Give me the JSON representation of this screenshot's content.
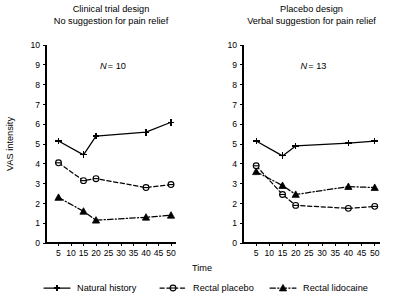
{
  "figure": {
    "y_axis_label": "VAS intensity",
    "x_axis_label": "Time"
  },
  "legend": {
    "items": [
      {
        "label": "Natural history",
        "marker": "plus-marker",
        "line": "solid"
      },
      {
        "label": "Rectal placebo",
        "marker": "circle-marker",
        "line": "dashed"
      },
      {
        "label": "Rectal lidocaine",
        "marker": "triangle-marker",
        "line": "dash-dot"
      }
    ]
  },
  "chart_data": [
    {
      "type": "line",
      "panel": "left",
      "title": "Clinical trial design",
      "subtitle": "No suggestion for pain relief",
      "annotation": "N = 10",
      "annotation_symbol": "N",
      "annotation_value": "= 10",
      "xlabel": "Time",
      "ylabel": "VAS intensity",
      "xlim": [
        0,
        52
      ],
      "ylim": [
        0,
        10
      ],
      "xticks": [
        5,
        10,
        15,
        20,
        25,
        30,
        35,
        40,
        45,
        50
      ],
      "yticks": [
        0,
        1,
        2,
        3,
        4,
        5,
        6,
        7,
        8,
        9,
        10
      ],
      "grid": false,
      "x": [
        5,
        15,
        20,
        40,
        50
      ],
      "series": [
        {
          "name": "Natural history",
          "values": [
            5.15,
            4.45,
            5.4,
            5.6,
            6.1
          ]
        },
        {
          "name": "Rectal placebo",
          "values": [
            4.05,
            3.15,
            3.25,
            2.8,
            2.95
          ]
        },
        {
          "name": "Rectal lidocaine",
          "values": [
            2.3,
            1.6,
            1.15,
            1.3,
            1.4
          ]
        }
      ]
    },
    {
      "type": "line",
      "panel": "right",
      "title": "Placebo design",
      "subtitle": "Verbal suggestion for pain relief",
      "annotation": "N = 13",
      "annotation_symbol": "N",
      "annotation_value": "= 13",
      "xlabel": "Time",
      "ylabel": "VAS intensity",
      "xlim": [
        0,
        52
      ],
      "ylim": [
        0,
        10
      ],
      "xticks": [
        5,
        10,
        15,
        20,
        25,
        30,
        35,
        40,
        45,
        50
      ],
      "yticks": [
        0,
        1,
        2,
        3,
        4,
        5,
        6,
        7,
        8,
        9,
        10
      ],
      "grid": false,
      "x": [
        5,
        15,
        20,
        40,
        50
      ],
      "series": [
        {
          "name": "Natural history",
          "values": [
            5.15,
            4.4,
            4.9,
            5.05,
            5.15
          ]
        },
        {
          "name": "Rectal placebo",
          "values": [
            3.9,
            2.45,
            1.9,
            1.75,
            1.85
          ]
        },
        {
          "name": "Rectal lidocaine",
          "values": [
            3.6,
            2.9,
            2.45,
            2.85,
            2.8
          ]
        }
      ]
    }
  ]
}
